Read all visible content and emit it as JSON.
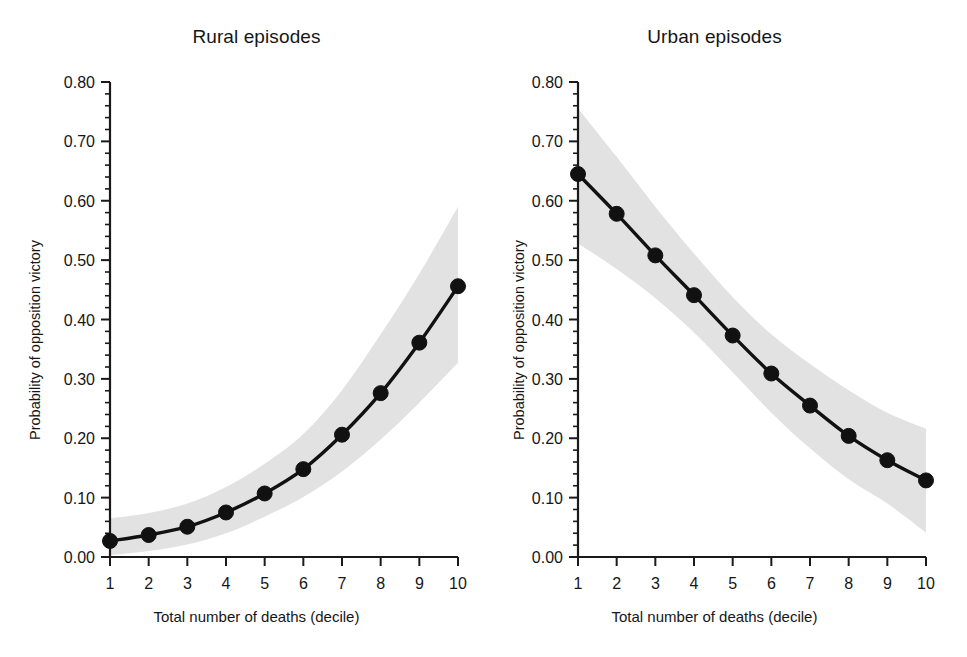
{
  "figure": {
    "background": "#ffffff",
    "line_color": "#111111",
    "band_color": "#e2e2e2",
    "axis_color": "#1a1a1a"
  },
  "panels": [
    {
      "key": "rural",
      "title": "Rural episodes",
      "xlabel": "Total number of deaths (decile)",
      "ylabel": "Probability of opposition victory"
    },
    {
      "key": "urban",
      "title": "Urban episodes",
      "xlabel": "Total number of deaths (decile)",
      "ylabel": "Probability of opposition victory"
    }
  ],
  "axis": {
    "y_ticks": [
      "0.00",
      "0.10",
      "0.20",
      "0.30",
      "0.40",
      "0.50",
      "0.60",
      "0.70",
      "0.80"
    ],
    "x_ticks": [
      "1",
      "2",
      "3",
      "4",
      "5",
      "6",
      "7",
      "8",
      "9",
      "10"
    ],
    "y_min": 0.0,
    "y_max": 0.8,
    "y_major_step": 0.1,
    "y_minor_per_major": 5,
    "x_min": 1,
    "x_max": 10
  },
  "caption": {
    "text": ""
  },
  "chart_data": [
    {
      "type": "line",
      "title": "Rural episodes",
      "xlabel": "Total number of deaths (decile)",
      "ylabel": "Probability of opposition victory",
      "x": [
        1,
        2,
        3,
        4,
        5,
        6,
        7,
        8,
        9,
        10
      ],
      "categories": [
        "1",
        "2",
        "3",
        "4",
        "5",
        "6",
        "7",
        "8",
        "9",
        "10"
      ],
      "values": [
        0.027,
        0.037,
        0.051,
        0.075,
        0.107,
        0.148,
        0.206,
        0.276,
        0.361,
        0.456
      ],
      "ci_lower": [
        0.003,
        0.01,
        0.021,
        0.04,
        0.068,
        0.101,
        0.144,
        0.198,
        0.26,
        0.327
      ],
      "ci_upper": [
        0.065,
        0.074,
        0.09,
        0.118,
        0.157,
        0.207,
        0.281,
        0.375,
        0.477,
        0.59
      ],
      "ci_label": "95% confidence interval",
      "xlim": [
        1,
        10
      ],
      "ylim": [
        0.0,
        0.8
      ],
      "ytick_values": [
        0.0,
        0.1,
        0.2,
        0.3,
        0.4,
        0.5,
        0.6,
        0.7,
        0.8
      ],
      "ytick_labels": [
        "0.00",
        "0.10",
        "0.20",
        "0.30",
        "0.40",
        "0.50",
        "0.60",
        "0.70",
        "0.80"
      ],
      "xtick_values": [
        1,
        2,
        3,
        4,
        5,
        6,
        7,
        8,
        9,
        10
      ],
      "xtick_labels": [
        "1",
        "2",
        "3",
        "4",
        "5",
        "6",
        "7",
        "8",
        "9",
        "10"
      ],
      "grid": false,
      "legend": false,
      "marker": "circle",
      "line_color": "#111111",
      "band_color": "#e2e2e2"
    },
    {
      "type": "line",
      "title": "Urban episodes",
      "xlabel": "Total number of deaths (decile)",
      "ylabel": "Probability of opposition victory",
      "x": [
        1,
        2,
        3,
        4,
        5,
        6,
        7,
        8,
        9,
        10
      ],
      "categories": [
        "1",
        "2",
        "3",
        "4",
        "5",
        "6",
        "7",
        "8",
        "9",
        "10"
      ],
      "values": [
        0.645,
        0.578,
        0.508,
        0.441,
        0.373,
        0.309,
        0.255,
        0.204,
        0.163,
        0.129
      ],
      "ci_lower": [
        0.528,
        0.485,
        0.436,
        0.378,
        0.311,
        0.243,
        0.183,
        0.131,
        0.09,
        0.041
      ],
      "ci_upper": [
        0.756,
        0.674,
        0.59,
        0.511,
        0.438,
        0.375,
        0.325,
        0.281,
        0.243,
        0.216
      ],
      "ci_label": "95% confidence interval",
      "xlim": [
        1,
        10
      ],
      "ylim": [
        0.0,
        0.8
      ],
      "ytick_values": [
        0.0,
        0.1,
        0.2,
        0.3,
        0.4,
        0.5,
        0.6,
        0.7,
        0.8
      ],
      "ytick_labels": [
        "0.00",
        "0.10",
        "0.20",
        "0.30",
        "0.40",
        "0.50",
        "0.60",
        "0.70",
        "0.80"
      ],
      "xtick_values": [
        1,
        2,
        3,
        4,
        5,
        6,
        7,
        8,
        9,
        10
      ],
      "xtick_labels": [
        "1",
        "2",
        "3",
        "4",
        "5",
        "6",
        "7",
        "8",
        "9",
        "10"
      ],
      "grid": false,
      "legend": false,
      "marker": "circle",
      "line_color": "#111111",
      "band_color": "#e2e2e2"
    }
  ]
}
